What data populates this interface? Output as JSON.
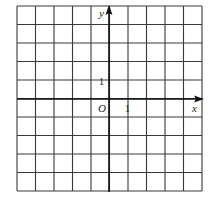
{
  "diagram": {
    "type": "coordinate-grid",
    "grid": {
      "columns": 10,
      "rows": 10,
      "left": 17,
      "top": 6,
      "cell_size": 18.5,
      "line_color": "#3a3a3a"
    },
    "origin": {
      "px_x": 109,
      "px_y": 99
    },
    "axes": {
      "x_label": "x",
      "y_label": "y",
      "origin_label": "O",
      "axis_color": "#111111"
    },
    "ticks": {
      "x_unit_label": "1",
      "y_unit_label": "1"
    }
  }
}
